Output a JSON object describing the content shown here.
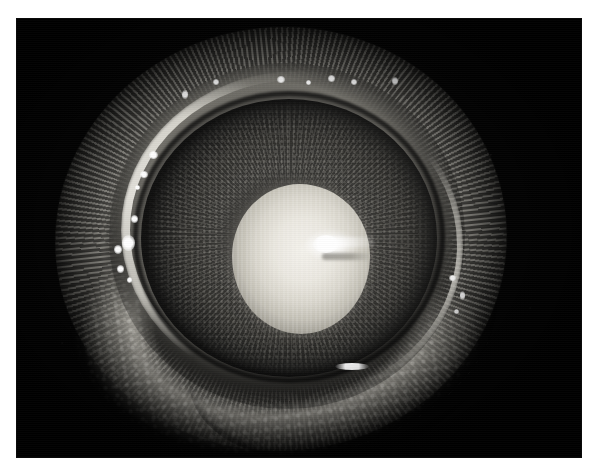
{
  "page": {
    "background_color": "#ffffff",
    "width": 600,
    "height": 470
  },
  "photo": {
    "kind": "clinical-photograph",
    "modality": "anterior-segment / slit-lamp photograph",
    "color_mode": "grayscale",
    "caption": "",
    "frame": {
      "x": 17,
      "y": 19,
      "width": 564,
      "height": 438,
      "background_color": "#030303",
      "border_color": "#0a0a0a"
    },
    "alt_text": "Grayscale close-up photograph of a human eye showing a dense white opacity filling the pupil, surrounded by a dark iris, a bright limbal ring, and surrounding eyelid margin with lashes against a black background.",
    "subject": {
      "name": "human eye",
      "view": "frontal close-up",
      "finding": "dense white pupillary opacity (leukocoria / mature cataract)"
    },
    "anatomy": [
      {
        "name": "eyelashes",
        "region": "outer annulus",
        "tone": "mid-gray striated"
      },
      {
        "name": "eyelid margin",
        "region": "inferior-temporal crescent",
        "tone": "bright mottled"
      },
      {
        "name": "sclera",
        "region": "globe surface",
        "tone": "mid-gray"
      },
      {
        "name": "limbus",
        "region": "corneoscleral junction ring",
        "tone": "bright arc"
      },
      {
        "name": "iris",
        "region": "annulus around pupil",
        "tone": "dark gray with radial crypts"
      },
      {
        "name": "pupil",
        "region": "center",
        "tone": "opaque white"
      },
      {
        "name": "lens opacity",
        "region": "center",
        "tone": "white with vertical banding"
      }
    ],
    "colors": {
      "background": "#030303",
      "lens_opacity_highlight": "#f4f2ec",
      "lens_opacity_midtone": "#d9d6cd",
      "lens_opacity_shadow": "#6e6c65",
      "iris": "#403f3c",
      "sclera": "#7c7a73",
      "limbal_arc": "#f4f2eb",
      "lid_margin": "#c4c1b8",
      "lash": "#767470",
      "specular_highlight": "#ffffff"
    },
    "specular_highlights": [
      {
        "id": "sup-limbus-1",
        "x": 165,
        "y": 71,
        "w": 6,
        "h": 9
      },
      {
        "id": "sup-limbus-2",
        "x": 196,
        "y": 60,
        "w": 6,
        "h": 6
      },
      {
        "id": "sup-limbus-3",
        "x": 260,
        "y": 57,
        "w": 8,
        "h": 7
      },
      {
        "id": "sup-limbus-4",
        "x": 289,
        "y": 61,
        "w": 5,
        "h": 5
      },
      {
        "id": "sup-limbus-5",
        "x": 311,
        "y": 56,
        "w": 7,
        "h": 7
      },
      {
        "id": "sup-limbus-6",
        "x": 334,
        "y": 60,
        "w": 6,
        "h": 6
      },
      {
        "id": "sup-limbus-7",
        "x": 375,
        "y": 58,
        "w": 6,
        "h": 8
      },
      {
        "id": "nas-chain-1",
        "x": 132,
        "y": 132,
        "w": 9,
        "h": 8
      },
      {
        "id": "nas-chain-2",
        "x": 123,
        "y": 152,
        "w": 8,
        "h": 7
      },
      {
        "id": "nas-chain-3",
        "x": 118,
        "y": 166,
        "w": 5,
        "h": 5
      },
      {
        "id": "nas-chain-4",
        "x": 114,
        "y": 196,
        "w": 7,
        "h": 8
      },
      {
        "id": "nas-chain-5",
        "x": 105,
        "y": 216,
        "w": 13,
        "h": 16
      },
      {
        "id": "nas-chain-6",
        "x": 97,
        "y": 226,
        "w": 8,
        "h": 9
      },
      {
        "id": "nas-chain-7",
        "x": 100,
        "y": 246,
        "w": 7,
        "h": 8
      },
      {
        "id": "nas-chain-8",
        "x": 110,
        "y": 258,
        "w": 5,
        "h": 6
      },
      {
        "id": "inf-temp-1",
        "x": 432,
        "y": 256,
        "w": 7,
        "h": 6
      },
      {
        "id": "inf-temp-2",
        "x": 443,
        "y": 272,
        "w": 5,
        "h": 9
      },
      {
        "id": "inf-temp-3",
        "x": 437,
        "y": 290,
        "w": 5,
        "h": 5
      },
      {
        "id": "inf-streak",
        "x": 318,
        "y": 344,
        "w": 34,
        "h": 7
      },
      {
        "id": "lens-center-flash",
        "x": 296,
        "y": 216,
        "w": 26,
        "h": 18
      }
    ]
  }
}
